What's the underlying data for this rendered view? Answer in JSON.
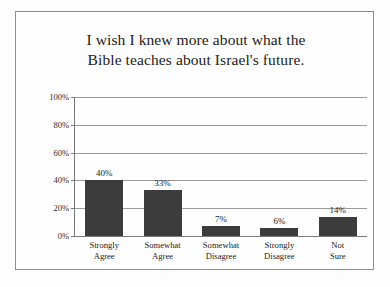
{
  "chart_data": {
    "type": "bar",
    "title": "I wish I knew more about what the Bible teaches about Israel's future.",
    "title_lines": [
      "I wish I knew more about what the",
      "Bible teaches about Israel's future."
    ],
    "categories": [
      "Strongly Agree",
      "Somewhat Agree",
      "Somewhat Disagree",
      "Strongly Disagree",
      "Not Sure"
    ],
    "category_lines": [
      [
        "Strongly",
        "Agree"
      ],
      [
        "Somewhat",
        "Agree"
      ],
      [
        "Somewhat",
        "Disagree"
      ],
      [
        "Strongly",
        "Disagree"
      ],
      [
        "Not",
        "Sure"
      ]
    ],
    "values": [
      40,
      33,
      7,
      6,
      14
    ],
    "value_labels": [
      "40%",
      "33%",
      "7%",
      "6%",
      "14%"
    ],
    "xlabel": "",
    "ylabel": "",
    "ylim": [
      0,
      100
    ],
    "yticks": [
      0,
      20,
      40,
      60,
      80,
      100
    ],
    "ytick_labels": [
      "0%",
      "20%",
      "40%",
      "60%",
      "80%",
      "100%"
    ],
    "grid": true,
    "legend": false,
    "bar_color": "#3c3c3c",
    "gridline_color": "#9a9a9a",
    "axis_color": "#7a7a7a",
    "frame_color": "#8d8d8d",
    "background_color": "#fefefe"
  }
}
